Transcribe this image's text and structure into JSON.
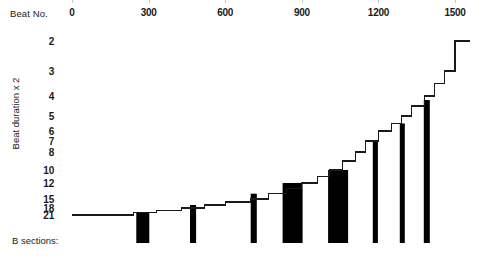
{
  "axes": {
    "x_title": "Beat No.",
    "y_title": "Beat duration x 2",
    "bottom_label": "B sections:"
  },
  "chart_data": {
    "type": "line",
    "subtype": "step-post",
    "title": "",
    "xlabel": "Beat No.",
    "ylabel": "Beat duration x 2",
    "xlim": [
      0,
      1560
    ],
    "xticks": [
      0,
      300,
      600,
      900,
      1200,
      1500
    ],
    "xticklabels": [
      "0",
      "300",
      "600",
      "900",
      "1200",
      "1500"
    ],
    "xaxis_position": "top",
    "yticks": [
      2,
      3,
      4,
      5,
      6,
      7,
      8,
      10,
      12,
      15,
      18,
      21
    ],
    "yticklabels": [
      "2",
      "3",
      "4",
      "5",
      "6",
      "7",
      "8",
      "10",
      "12",
      "15",
      "18",
      "21"
    ],
    "y_inverted": true,
    "y_scale": "ordinal-nonlinear",
    "grid": false,
    "legend": false,
    "series": [
      {
        "name": "Beat duration x 2",
        "x": [
          0,
          240,
          330,
          430,
          520,
          600,
          700,
          770,
          840,
          900,
          960,
          1010,
          1060,
          1110,
          1150,
          1200,
          1250,
          1290,
          1330,
          1380,
          1420,
          1460,
          1500
        ],
        "y": [
          21,
          20,
          19,
          18,
          17,
          16,
          15,
          14,
          13,
          12,
          11,
          10,
          9,
          8,
          7,
          6,
          5.5,
          5,
          4.5,
          4,
          3.5,
          3,
          2
        ]
      }
    ],
    "bars": {
      "name": "B sections",
      "color": "#000000",
      "baseline_y": 21,
      "items": [
        {
          "index": 1,
          "x_start": 252,
          "x_end": 300,
          "top_level": 20,
          "width_px": 13
        },
        {
          "index": 2,
          "x_start": 462,
          "x_end": 486,
          "top_level": 17,
          "width_px": 6
        },
        {
          "index": 3,
          "x_start": 700,
          "x_end": 724,
          "top_level": 14,
          "width_px": 6
        },
        {
          "index": 4,
          "x_start": 825,
          "x_end": 900,
          "top_level": 12,
          "width_px": 20
        },
        {
          "index": 5,
          "x_start": 1003,
          "x_end": 1078,
          "top_level": 10,
          "width_px": 20
        },
        {
          "index": 6,
          "x_start": 1178,
          "x_end": 1198,
          "top_level": 7,
          "width_px": 5
        },
        {
          "index": 7,
          "x_start": 1284,
          "x_end": 1303,
          "top_level": 5.5,
          "width_px": 5
        },
        {
          "index": 8,
          "x_start": 1378,
          "x_end": 1400,
          "top_level": 4.2,
          "width_px": 6
        }
      ]
    }
  }
}
